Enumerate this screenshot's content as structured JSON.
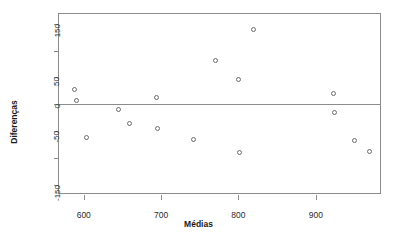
{
  "chart_data": {
    "type": "scatter",
    "title": "",
    "xlabel": "Médias",
    "ylabel": "Diferenças",
    "xlim": [
      568,
      983
    ],
    "ylim": [
      -165,
      168
    ],
    "grid": false,
    "legend": null,
    "x_ticks": [
      600,
      700,
      800,
      900
    ],
    "x_tick_labels": [
      "600",
      "700",
      "800",
      "900"
    ],
    "y_ticks": [
      -150,
      -100,
      -50,
      0,
      50,
      100,
      150
    ],
    "y_tick_labels": [
      "-150",
      "",
      "-50",
      "0",
      "50",
      "",
      "150"
    ],
    "reference_lines": [
      {
        "y": 0,
        "color": "#8c8c8c"
      }
    ],
    "marker": {
      "shape": "circle",
      "filled": false,
      "color": "#6b6b6b",
      "size": 5
    },
    "points": [
      {
        "x": 588,
        "y": 27
      },
      {
        "x": 591,
        "y": 8
      },
      {
        "x": 604,
        "y": -61
      },
      {
        "x": 645,
        "y": -10
      },
      {
        "x": 659,
        "y": -36
      },
      {
        "x": 694,
        "y": 13
      },
      {
        "x": 695,
        "y": -45
      },
      {
        "x": 742,
        "y": -66
      },
      {
        "x": 770,
        "y": 81
      },
      {
        "x": 800,
        "y": 47
      },
      {
        "x": 801,
        "y": -90
      },
      {
        "x": 819,
        "y": 140
      },
      {
        "x": 923,
        "y": 20
      },
      {
        "x": 924,
        "y": -15
      },
      {
        "x": 950,
        "y": -68
      },
      {
        "x": 970,
        "y": -88
      }
    ]
  },
  "axis_titles": {
    "x": "Médias",
    "y": "Diferenças"
  },
  "colors": {
    "frame": "#8c8c8c",
    "marker": "#6b6b6b",
    "text": "#1a1a1a",
    "background": "#ffffff"
  }
}
